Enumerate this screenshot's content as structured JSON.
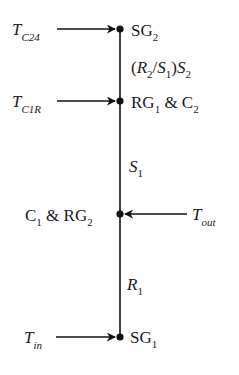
{
  "diagram": {
    "type": "signal-flow / node diagram",
    "line_color": "#111111",
    "background": "#ffffff",
    "nodes": [
      {
        "id": "SG2",
        "label_main": "SG",
        "label_sub": "2"
      },
      {
        "id": "RG1C2",
        "label_part1": "RG",
        "label_part1_sub": "1",
        "label_mid": " & C",
        "label_part2_sub": "2"
      },
      {
        "id": "C1RG2",
        "label_part1": "C",
        "label_part1_sub": "1",
        "label_mid": " & RG",
        "label_part2_sub": "2"
      },
      {
        "id": "SG1",
        "label_main": "SG",
        "label_sub": "1"
      }
    ],
    "inputs": [
      {
        "to": "SG2",
        "symbol": "T",
        "subscript": "C24",
        "side": "left"
      },
      {
        "to": "RG1C2",
        "symbol": "T",
        "subscript": "C1R",
        "side": "left"
      },
      {
        "to": "C1RG2",
        "symbol": "T",
        "subscript": "out",
        "side": "right"
      },
      {
        "to": "SG1",
        "symbol": "T",
        "subscript": "in",
        "side": "left"
      }
    ],
    "edges": [
      {
        "from": "SG2",
        "to": "RG1C2",
        "label": {
          "open": "(",
          "R": "R",
          "R_sub": "2",
          "slash": "/",
          "S": "S",
          "S_sub": "1",
          "close": ")",
          "S2": "S",
          "S2_sub": "2"
        }
      },
      {
        "from": "RG1C2",
        "to": "C1RG2",
        "label": {
          "symbol": "S",
          "sub": "1"
        }
      },
      {
        "from": "C1RG2",
        "to": "SG1",
        "label": {
          "symbol": "R",
          "sub": "1"
        }
      }
    ]
  }
}
